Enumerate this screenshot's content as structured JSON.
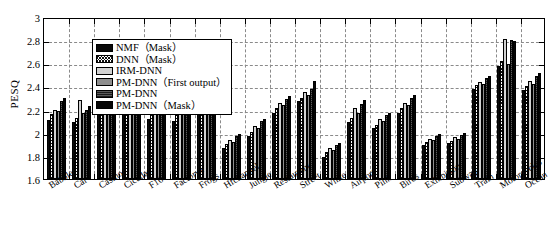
{
  "chart_data": {
    "type": "bar",
    "title": "",
    "xlabel": "",
    "ylabel": "PESQ",
    "ylim": [
      1.6,
      3.0
    ],
    "ytick_step": 0.2,
    "yticks": [
      "3",
      "2.8",
      "2.6",
      "2.4",
      "2.2",
      "2",
      "1.8",
      "1.6"
    ],
    "grid": true,
    "legend_position": "upper-left-inside",
    "categories": [
      "Babble",
      "Car",
      "Casino",
      "Cicadas",
      "F16",
      "Factory1",
      "Frogs",
      "Hfchannel",
      "Jungle",
      "Restaurant",
      "Street",
      "White",
      "Airport",
      "Pink",
      "Birds",
      "Exhibition",
      "Subway",
      "Train",
      "Motorcycles",
      "Ocean"
    ],
    "series": [
      {
        "name": "NMF（Mask）",
        "values": [
          2.11,
          2.09,
          2.16,
          2.21,
          2.12,
          2.1,
          2.26,
          1.87,
          1.97,
          2.17,
          2.27,
          1.79,
          2.09,
          2.04,
          2.17,
          1.89,
          1.91,
          2.38,
          2.58,
          2.37
        ]
      },
      {
        "name": "DNN（Mask）",
        "values": [
          2.16,
          2.13,
          2.22,
          2.24,
          2.16,
          2.15,
          2.29,
          1.9,
          2.01,
          2.21,
          2.3,
          1.83,
          2.13,
          2.07,
          2.21,
          1.92,
          1.93,
          2.41,
          2.62,
          2.4
        ]
      },
      {
        "name": "IRM-DNN",
        "values": [
          2.2,
          2.28,
          2.27,
          2.34,
          2.21,
          2.2,
          2.32,
          1.94,
          2.06,
          2.26,
          2.35,
          1.87,
          2.21,
          2.12,
          2.26,
          1.95,
          1.96,
          2.44,
          2.81,
          2.45
        ]
      },
      {
        "name": "PM-DNN（First output）",
        "values": [
          2.19,
          2.17,
          2.26,
          2.3,
          2.19,
          2.18,
          2.31,
          1.92,
          2.04,
          2.24,
          2.33,
          1.85,
          2.17,
          2.1,
          2.24,
          1.94,
          1.95,
          2.42,
          2.59,
          2.42
        ]
      },
      {
        "name": "PM-DNN",
        "values": [
          2.27,
          2.2,
          2.31,
          2.37,
          2.24,
          2.23,
          2.34,
          1.97,
          2.1,
          2.29,
          2.38,
          1.89,
          2.25,
          2.15,
          2.3,
          1.97,
          1.98,
          2.47,
          2.8,
          2.49
        ]
      },
      {
        "name": "PM-DNN（Mask）",
        "values": [
          2.3,
          2.23,
          2.34,
          2.39,
          2.26,
          2.25,
          2.36,
          1.99,
          2.12,
          2.32,
          2.45,
          1.91,
          2.28,
          2.17,
          2.33,
          1.99,
          2.0,
          2.49,
          2.79,
          2.52
        ]
      }
    ]
  },
  "legend": {
    "items": [
      {
        "label": "NMF（Mask）",
        "swatch": "solid-black"
      },
      {
        "label": "DNN（Mask）",
        "swatch": "crosshatch"
      },
      {
        "label": "IRM-DNN",
        "swatch": "light-gray"
      },
      {
        "label": "PM-DNN（First output）",
        "swatch": "medium-gray"
      },
      {
        "label": "PM-DNN",
        "swatch": "dark-gray-textured"
      },
      {
        "label": "PM-DNN（Mask）",
        "swatch": "solid-black"
      }
    ]
  }
}
